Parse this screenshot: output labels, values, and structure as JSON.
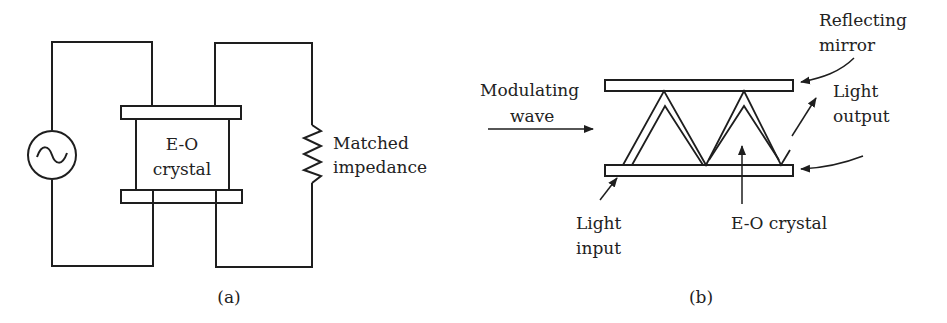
{
  "panel_a": {
    "caption": "(a)",
    "crystal_label_line1": "E-O",
    "crystal_label_line2": "crystal",
    "impedance_label_line1": "Matched",
    "impedance_label_line2": "impedance",
    "source_symbol": "~"
  },
  "panel_b": {
    "caption": "(b)",
    "mirror_label_line1": "Reflecting",
    "mirror_label_line2": "mirror",
    "output_label_line1": "Light",
    "output_label_line2": "output",
    "modulating_label_line1": "Modulating",
    "modulating_label_line2": "wave",
    "input_label_line1": "Light",
    "input_label_line2": "input",
    "crystal_label": "E-O crystal"
  },
  "colors": {
    "stroke": "#1e1e1e",
    "background": "#ffffff"
  }
}
